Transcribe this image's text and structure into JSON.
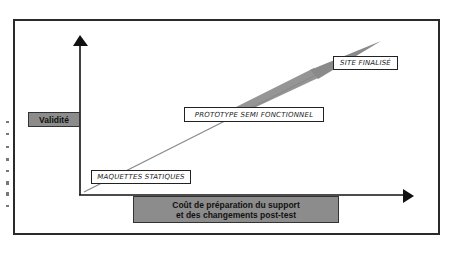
{
  "diagram": {
    "y_axis_label": "Validité",
    "x_axis_label_line1": "Coût de préparation du support",
    "x_axis_label_line2": "et des changements post-test",
    "stages": [
      {
        "label": "MAQUETTES STATIQUES"
      },
      {
        "label": "PROTOTYPE SEMI FONCTIONNEL"
      },
      {
        "label": "SITE FINALISÉ"
      }
    ],
    "colors": {
      "axis_label_fill": "#8c8c8c",
      "trend_arrow": "#8a8a8a",
      "axis": "#111111"
    }
  }
}
